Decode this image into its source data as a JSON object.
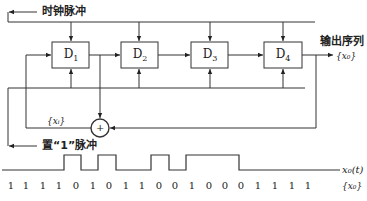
{
  "diagram": {
    "clock_label": "时钟脉冲",
    "set_label": "置“1”脉冲",
    "output_label": "输出序列",
    "output_seq": "{x₀}",
    "feedback_label": "{xᵢ}",
    "xor_symbol": "+",
    "registers": [
      {
        "name": "D",
        "sub": "1"
      },
      {
        "name": "D",
        "sub": "2"
      },
      {
        "name": "D",
        "sub": "3"
      },
      {
        "name": "D",
        "sub": "4"
      }
    ],
    "waveform_label": "x₀(t)",
    "sequence_label": "{x₀}",
    "bits": [
      "1",
      "1",
      "1",
      "1",
      "0",
      "1",
      "0",
      "1",
      "1",
      "0",
      "0",
      "1",
      "0",
      "0",
      "0",
      "1",
      "1",
      "1",
      "1"
    ]
  }
}
